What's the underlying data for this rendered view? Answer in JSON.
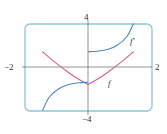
{
  "chart_data": {
    "type": "line",
    "title": "",
    "xlabel": "",
    "ylabel": "",
    "xlim": [
      -2,
      2
    ],
    "ylim": [
      -4,
      4
    ],
    "grid": false,
    "tick_labels": {
      "x_left": "−2",
      "x_right": "2",
      "y_top": "4",
      "y_bottom": "−4"
    },
    "series": [
      {
        "name": "f",
        "label": "f",
        "color": "#d9607a",
        "x": [
          -1.4,
          -1.0,
          -0.6,
          -0.3,
          0.0,
          0.3,
          0.6,
          1.0,
          1.4
        ],
        "y": [
          1.4,
          0.4,
          -0.5,
          -1.1,
          -1.6,
          -1.1,
          -0.5,
          0.4,
          1.4
        ]
      },
      {
        "name": "f'",
        "label": "f′",
        "color": "#4a86c0",
        "segments": [
          {
            "x": [
              -1.4,
              -1.2,
              -0.9,
              -0.6,
              -0.3,
              0.0
            ],
            "y": [
              -4.0,
              -2.8,
              -2.0,
              -1.6,
              -1.45,
              -1.4
            ]
          },
          {
            "x": [
              0.0,
              0.3,
              0.6,
              0.9,
              1.2,
              1.4
            ],
            "y": [
              1.4,
              1.45,
              1.6,
              2.0,
              2.8,
              4.0
            ]
          }
        ]
      }
    ],
    "annotations": [
      {
        "text": "f",
        "x": 0.85,
        "y": -1.5
      },
      {
        "text": "f′",
        "x": 1.55,
        "y": 2.9
      }
    ]
  },
  "colors": {
    "frame": "#8fc3e0",
    "axes": "#555555",
    "f": "#d9607a",
    "f_prime": "#4a86c0"
  }
}
